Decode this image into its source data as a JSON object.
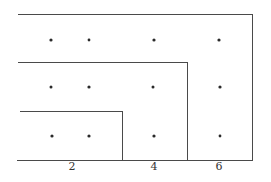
{
  "diagram": {
    "colors": {
      "line": "#4a4a4a",
      "dot": "#2a2a2a",
      "background": "#ffffff"
    },
    "axis_labels": [
      {
        "text": "2",
        "x": 72
      },
      {
        "text": "4",
        "x": 154
      },
      {
        "text": "6",
        "x": 219
      }
    ],
    "regions": [
      {
        "name": "outer-region",
        "top": 14,
        "right": 252
      },
      {
        "name": "middle-region",
        "top": 62,
        "right": 187
      },
      {
        "name": "inner-region",
        "top": 111,
        "right": 122
      }
    ],
    "dot_columns": [
      51,
      89,
      154,
      219
    ],
    "dot_rows": [
      40,
      87,
      136
    ]
  }
}
